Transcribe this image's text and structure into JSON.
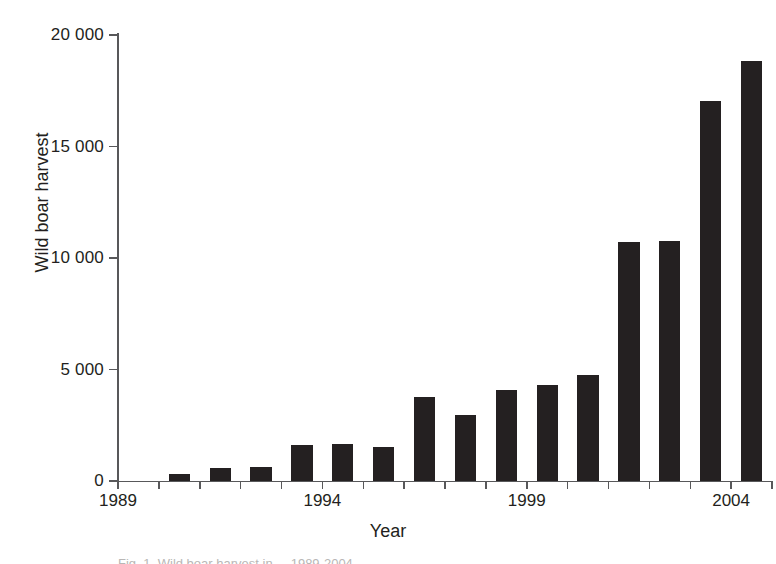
{
  "chart_data": {
    "type": "bar",
    "title": "",
    "xlabel": "Year",
    "ylabel": "Wild boar harvest",
    "categories": [
      1989,
      1990,
      1991,
      1992,
      1993,
      1994,
      1995,
      1996,
      1997,
      1998,
      1999,
      2000,
      2001,
      2002,
      2003,
      2004
    ],
    "values": [
      0,
      310,
      580,
      630,
      1610,
      1660,
      1530,
      3770,
      2960,
      4060,
      4300,
      4760,
      10700,
      10750,
      17050,
      18850
    ],
    "series": [
      {
        "name": "Wild boar harvest",
        "values": [
          0,
          310,
          580,
          630,
          1610,
          1660,
          1530,
          3770,
          2960,
          4060,
          4300,
          4760,
          10700,
          10750,
          17050,
          18850
        ]
      }
    ],
    "ylim": [
      0,
      20000
    ],
    "xlim": [
      1989,
      2004
    ],
    "y_ticks": [
      0,
      5000,
      10000,
      15000,
      20000
    ],
    "y_tick_labels": [
      "0",
      "5 000",
      "10 000",
      "15 000",
      "20 000"
    ],
    "x_ticks": [
      1989,
      1990,
      1991,
      1992,
      1993,
      1994,
      1995,
      1996,
      1997,
      1998,
      1999,
      2000,
      2001,
      2002,
      2003,
      2004
    ],
    "x_tick_labels_shown": [
      "1989",
      "1994",
      "1999",
      "2004"
    ],
    "x_labeled_ticks": [
      1989,
      1994,
      1999,
      2004
    ],
    "grid": false,
    "legend": null,
    "bar_color": "#242021",
    "axis_color": "#58585a",
    "text_color": "#231f20",
    "background": "#ffffff"
  },
  "caption": {
    "partial_text": "Fig. 1. Wild boar harvest in  ...  1989-2004"
  }
}
